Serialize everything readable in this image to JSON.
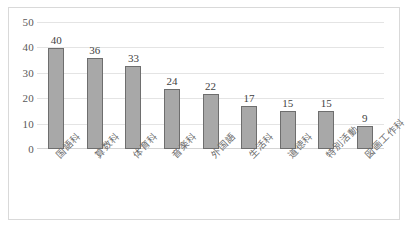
{
  "chart_data": {
    "type": "bar",
    "title": "",
    "subtitle": "",
    "xlabel": "",
    "ylabel": "",
    "ylim": [
      0,
      50
    ],
    "y_ticks": [
      50,
      40,
      30,
      20,
      10,
      0
    ],
    "grid": true,
    "legend": false,
    "legend_position": "none",
    "orientation": "vertical",
    "categories": [
      "国語科",
      "算数科",
      "体育科",
      "音楽科",
      "外国語",
      "生活科",
      "道徳科",
      "特別活動",
      "図画工作科"
    ],
    "values": [
      40,
      36,
      33,
      24,
      22,
      17,
      15,
      15,
      9
    ],
    "data_labels": [
      "40",
      "36",
      "33",
      "24",
      "22",
      "17",
      "15",
      "15",
      "9"
    ],
    "colors": {
      "bar_fill": "#a8a8a8",
      "bar_border": "#6e6e6e",
      "gridline": "#e4e4e4",
      "axis_text": "#595959",
      "category_text": "#6b6b6b",
      "value_text": "#3f3f3f",
      "frame_border": "#d9d9d9",
      "background": "#ffffff"
    }
  }
}
